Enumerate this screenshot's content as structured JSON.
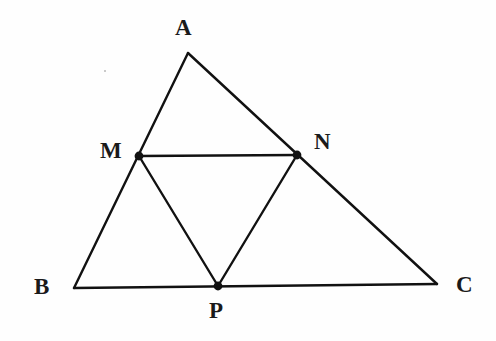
{
  "figure": {
    "kind": "geometry-diagram",
    "background_color": "#fefefe",
    "stroke_color": "#111111",
    "label_color": "#1a1a1a",
    "stroke_width": 2.4,
    "canvas": {
      "width": 496,
      "height": 341
    }
  },
  "points": [
    {
      "id": "A",
      "label": "A",
      "x": 188,
      "y": 53,
      "marker": false,
      "label_x": 175,
      "label_y": 16
    },
    {
      "id": "B",
      "label": "B",
      "x": 74,
      "y": 288,
      "marker": false,
      "label_x": 34,
      "label_y": 275
    },
    {
      "id": "C",
      "label": "C",
      "x": 437,
      "y": 284,
      "marker": false,
      "label_x": 456,
      "label_y": 273
    },
    {
      "id": "M",
      "label": "M",
      "x": 139,
      "y": 156,
      "marker": true,
      "label_x": 100,
      "label_y": 139
    },
    {
      "id": "N",
      "label": "N",
      "x": 297,
      "y": 155,
      "marker": true,
      "label_x": 314,
      "label_y": 130
    },
    {
      "id": "P",
      "label": "P",
      "x": 218,
      "y": 286,
      "marker": true,
      "label_x": 209,
      "label_y": 299
    }
  ],
  "segments": [
    {
      "id": "AB",
      "from": "A",
      "to": "B",
      "name": "segment-ab"
    },
    {
      "id": "AC",
      "from": "A",
      "to": "C",
      "name": "segment-ac"
    },
    {
      "id": "BC",
      "from": "B",
      "to": "C",
      "name": "segment-bc"
    },
    {
      "id": "MN",
      "from": "M",
      "to": "N",
      "name": "segment-mn"
    },
    {
      "id": "MP",
      "from": "M",
      "to": "P",
      "name": "segment-mp"
    },
    {
      "id": "NP",
      "from": "N",
      "to": "P",
      "name": "segment-np"
    }
  ],
  "marker_radius": 4.4,
  "artifacts": [
    {
      "id": "speck-1",
      "x": 104,
      "y": 70
    }
  ]
}
